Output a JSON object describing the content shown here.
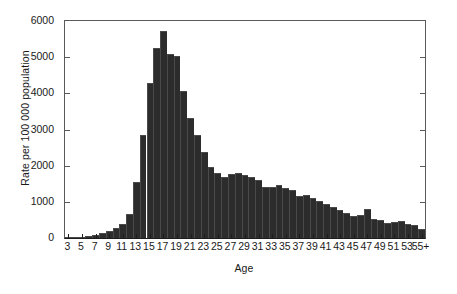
{
  "chart_data": {
    "type": "bar",
    "title": "",
    "subtitle": "",
    "xlabel": "Age",
    "ylabel": "Rate per 100 000 population",
    "xlim": [
      3,
      56
    ],
    "ylim": [
      0,
      6000
    ],
    "grid": false,
    "legend": null,
    "legend_position": "none",
    "bar_color": "#2c2c2c",
    "axis_color": "#5a5a5a",
    "x_tick_labels": [
      "3",
      "5",
      "7",
      "9",
      "11",
      "13",
      "15",
      "17",
      "19",
      "21",
      "23",
      "25",
      "27",
      "29",
      "31",
      "33",
      "35",
      "37",
      "39",
      "41",
      "43",
      "45",
      "47",
      "49",
      "51",
      "53",
      "55+"
    ],
    "y_tick_labels": [
      "0",
      "1000",
      "2000",
      "3000",
      "4000",
      "5000",
      "6000"
    ],
    "y_ticks": [
      0,
      1000,
      2000,
      3000,
      4000,
      5000,
      6000
    ],
    "categories": [
      "3",
      "4",
      "5",
      "6",
      "7",
      "8",
      "9",
      "10",
      "11",
      "12",
      "13",
      "14",
      "15",
      "16",
      "17",
      "18",
      "19",
      "20",
      "21",
      "22",
      "23",
      "24",
      "25",
      "26",
      "27",
      "28",
      "29",
      "30",
      "31",
      "32",
      "33",
      "34",
      "35",
      "36",
      "37",
      "38",
      "39",
      "40",
      "41",
      "42",
      "43",
      "44",
      "45",
      "46",
      "47",
      "48",
      "49",
      "50",
      "51",
      "52",
      "53",
      "54",
      "55+"
    ],
    "values": [
      10,
      20,
      35,
      60,
      95,
      140,
      200,
      290,
      390,
      670,
      1560,
      2840,
      4290,
      5250,
      5720,
      5080,
      5020,
      4060,
      3330,
      2850,
      2390,
      1960,
      1800,
      1700,
      1780,
      1790,
      1750,
      1690,
      1600,
      1400,
      1410,
      1470,
      1390,
      1340,
      1160,
      1190,
      1120,
      1010,
      930,
      860,
      770,
      690,
      620,
      640,
      800,
      530,
      500,
      420,
      450,
      460,
      390,
      350,
      250
    ]
  },
  "figure": {
    "background": "#ffffff"
  }
}
